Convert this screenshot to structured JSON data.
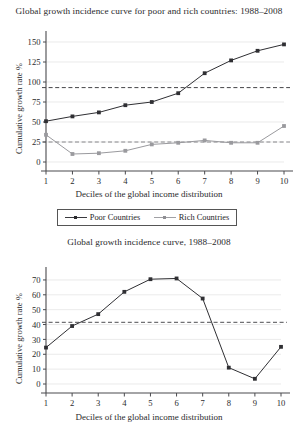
{
  "figure": {
    "legend": {
      "entries": [
        {
          "label": "Poor Countries",
          "color": "#2f2f33",
          "marker": "square"
        },
        {
          "label": "Rich Countries",
          "color": "#9a9a9e",
          "marker": "square"
        }
      ]
    }
  },
  "chart_data": [
    {
      "type": "line",
      "panel": "top",
      "title": "Global growth incidence curve for poor and rich countries: 1988–2008",
      "xlabel": "Deciles of the global income distribution",
      "ylabel": "Cumulative growth rate %",
      "categories": [
        1,
        2,
        3,
        4,
        5,
        6,
        7,
        8,
        9,
        10
      ],
      "xtick_labels": [
        "1",
        "2",
        "3",
        "4",
        "5",
        "6",
        "7",
        "8",
        "9",
        "10"
      ],
      "ytick_labels": [
        "0",
        "25",
        "50",
        "75",
        "100",
        "125",
        "150"
      ],
      "yticks": [
        0,
        25,
        50,
        75,
        100,
        125,
        150
      ],
      "ylim": [
        0,
        155
      ],
      "xlim": [
        1,
        10
      ],
      "grid": true,
      "legend_position": "below",
      "series": [
        {
          "name": "Poor Countries",
          "color": "#2f2f33",
          "values": [
            51,
            57,
            62,
            71,
            75,
            86,
            111,
            127,
            139,
            147
          ]
        },
        {
          "name": "Rich Countries",
          "color": "#9a9a9e",
          "values": [
            34,
            10,
            11,
            14,
            22,
            24,
            27,
            24,
            24,
            45
          ]
        }
      ],
      "reference_lines": [
        {
          "name": "poor-countries-mean",
          "value": 93,
          "style": "dashed",
          "color": "#2f2f33"
        },
        {
          "name": "rich-countries-mean",
          "value": 25,
          "style": "dashed",
          "color": "#7c7c80"
        }
      ]
    },
    {
      "type": "line",
      "panel": "bottom",
      "title": "Global growth incidence curve, 1988–2008",
      "xlabel": "Deciles of the global income distribution",
      "ylabel": "Cumulative growth rate %",
      "categories": [
        1,
        2,
        3,
        4,
        5,
        6,
        7,
        8,
        9,
        10
      ],
      "xtick_labels": [
        "1",
        "2",
        "3",
        "4",
        "5",
        "6",
        "7",
        "8",
        "9",
        "10"
      ],
      "ytick_labels": [
        "0",
        "10",
        "20",
        "30",
        "40",
        "50",
        "60",
        "70"
      ],
      "yticks": [
        0,
        10,
        20,
        30,
        40,
        50,
        60,
        70
      ],
      "ylim": [
        0,
        74
      ],
      "xlim": [
        1,
        10
      ],
      "grid": true,
      "legend_position": "none",
      "series": [
        {
          "name": "Global growth incidence",
          "color": "#2f2f33",
          "values": [
            24.5,
            39,
            47,
            62,
            70.5,
            71,
            57.5,
            11,
            3.5,
            25
          ]
        }
      ],
      "reference_lines": [
        {
          "name": "global-mean",
          "value": 41.5,
          "style": "dashed",
          "color": "#3a3a3e"
        }
      ]
    }
  ]
}
